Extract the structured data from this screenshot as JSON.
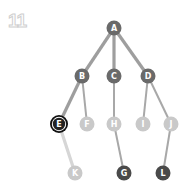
{
  "step_number": "11",
  "colors": {
    "dark": "#4a4a4a",
    "mid": "#6a6a6a",
    "light": "#c9c9c9",
    "edge_highlight": "#9e9e9e",
    "edge_normal": "#a8a8a8",
    "edge_light": "#d6d6d6"
  },
  "nodes": [
    {
      "id": "A",
      "x": 114,
      "y": 28,
      "state": "mid"
    },
    {
      "id": "B",
      "x": 82,
      "y": 76,
      "state": "mid"
    },
    {
      "id": "C",
      "x": 114,
      "y": 76,
      "state": "mid"
    },
    {
      "id": "D",
      "x": 148,
      "y": 76,
      "state": "mid"
    },
    {
      "id": "E",
      "x": 59,
      "y": 124,
      "state": "current"
    },
    {
      "id": "F",
      "x": 87,
      "y": 124,
      "state": "light"
    },
    {
      "id": "H",
      "x": 114,
      "y": 124,
      "state": "light"
    },
    {
      "id": "I",
      "x": 143,
      "y": 124,
      "state": "light"
    },
    {
      "id": "J",
      "x": 171,
      "y": 124,
      "state": "light"
    },
    {
      "id": "K",
      "x": 75,
      "y": 173,
      "state": "light"
    },
    {
      "id": "G",
      "x": 124,
      "y": 173,
      "state": "dark"
    },
    {
      "id": "L",
      "x": 163,
      "y": 173,
      "state": "dark"
    }
  ],
  "edges": [
    {
      "from": "A",
      "to": "B",
      "style": "highlight"
    },
    {
      "from": "A",
      "to": "C",
      "style": "highlight"
    },
    {
      "from": "A",
      "to": "D",
      "style": "highlight"
    },
    {
      "from": "B",
      "to": "E",
      "style": "highlight"
    },
    {
      "from": "B",
      "to": "F",
      "style": "normal"
    },
    {
      "from": "C",
      "to": "H",
      "style": "normal"
    },
    {
      "from": "D",
      "to": "I",
      "style": "normal"
    },
    {
      "from": "D",
      "to": "J",
      "style": "normal"
    },
    {
      "from": "E",
      "to": "K",
      "style": "light"
    },
    {
      "from": "H",
      "to": "G",
      "style": "normal"
    },
    {
      "from": "J",
      "to": "L",
      "style": "normal"
    }
  ]
}
